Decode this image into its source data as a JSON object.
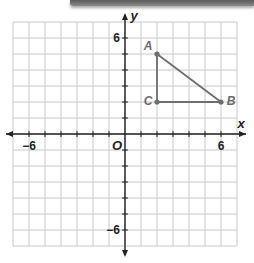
{
  "diagram": {
    "type": "coordinate-plane",
    "axes": {
      "x_label": "x",
      "y_label": "y",
      "origin_label": "O",
      "x_range": [
        -7,
        7
      ],
      "y_range": [
        -7,
        7
      ],
      "tick_step": 1,
      "labeled_ticks": {
        "x": [
          {
            "value": -6,
            "label": "−6"
          },
          {
            "value": 6,
            "label": "6"
          }
        ],
        "y": [
          {
            "value": 6,
            "label": "6"
          },
          {
            "value": -6,
            "label": "−6"
          }
        ]
      }
    },
    "points": [
      {
        "name": "A",
        "x": 2,
        "y": 5
      },
      {
        "name": "B",
        "x": 6,
        "y": 2
      },
      {
        "name": "C",
        "x": 2,
        "y": 2
      }
    ],
    "segments": [
      [
        "A",
        "B"
      ],
      [
        "A",
        "C"
      ],
      [
        "C",
        "B"
      ]
    ],
    "colors": {
      "grid": "#c8c8c8",
      "axis": "#222222",
      "figure": "#6e6e6e"
    }
  }
}
